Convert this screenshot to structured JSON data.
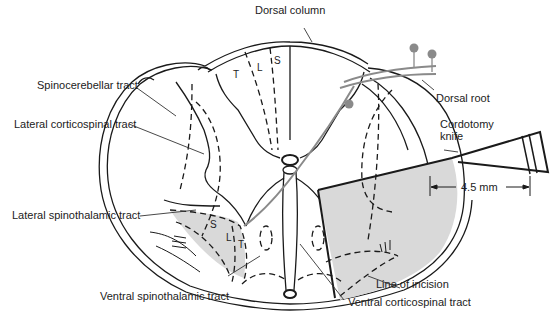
{
  "figure": {
    "colors": {
      "line": "#1a1a1a",
      "shaded_region": "#d9d9d9",
      "nerve_gray": "#8a8a8a",
      "text": "#222222",
      "background": "#ffffff"
    }
  },
  "labels": {
    "dorsal_column": "Dorsal column",
    "spinocerebellar_tract": "Spinocerebellar tract",
    "lateral_corticospinal_tract": "Lateral corticospinal tract",
    "dorsal_root": "Dorsal root",
    "cordotomy_knife_line1": "Cordotomy",
    "cordotomy_knife_line2": "knife",
    "measurement": "4.5 mm",
    "lateral_spinothalamic_tract": "Lateral spinothalamic tract",
    "line_of_incision": "Line of incision",
    "ventral_spinothalamic_tract": "Ventral spinothalamic tract",
    "ventral_corticospinal_tract": "Ventral corticospinal tract"
  },
  "zones": {
    "dorsal": {
      "t": "T",
      "l": "L",
      "s": "S"
    },
    "spinothalamic": {
      "s": "S",
      "l": "L",
      "t": "T"
    }
  }
}
